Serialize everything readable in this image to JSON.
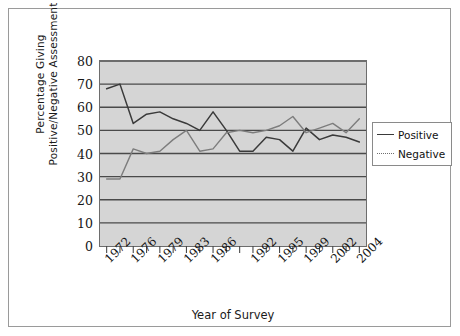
{
  "chart_data": {
    "type": "line",
    "title": "",
    "xlabel": "Year of Survey",
    "ylabel": "Percentage Giving Positive/Negative Assessment",
    "ylabel_lines": [
      "Percentage Giving",
      "Positive/Negative Assessment"
    ],
    "ylim": [
      0,
      80
    ],
    "yticks": [
      0,
      10,
      20,
      30,
      40,
      50,
      60,
      70,
      80
    ],
    "grid": true,
    "legend_position": "right",
    "x": [
      1972,
      1974,
      1976,
      1978,
      1979,
      1981,
      1983,
      1985,
      1986,
      1988,
      1990,
      1992,
      1993,
      1995,
      1997,
      1999,
      2000,
      2002,
      2003,
      2004
    ],
    "xtick_labels": [
      "1972",
      "1976",
      "1979",
      "1983",
      "1986",
      "1992",
      "1995",
      "1999",
      "2002",
      "2004"
    ],
    "xtick_label_positions": [
      0,
      2,
      4,
      6,
      8,
      11,
      13,
      15,
      17,
      19
    ],
    "series": [
      {
        "name": "Positive",
        "style": "solid",
        "color": "#3a3a3a",
        "values": [
          68,
          70,
          53,
          57,
          58,
          55,
          53,
          50,
          58,
          50,
          41,
          41,
          47,
          46,
          41,
          51,
          46,
          48,
          47,
          45
        ]
      },
      {
        "name": "Negative",
        "style": "dotted",
        "color": "#7d7d7d",
        "values": [
          29,
          29,
          42,
          40,
          41,
          46,
          50,
          41,
          42,
          49,
          50,
          49,
          50,
          52,
          56,
          49,
          51,
          53,
          49,
          55
        ]
      }
    ]
  },
  "legend": {
    "items": [
      {
        "label": "Positive",
        "key": "solid-line-key"
      },
      {
        "label": "Negative",
        "key": "dotted-line-key"
      }
    ]
  }
}
